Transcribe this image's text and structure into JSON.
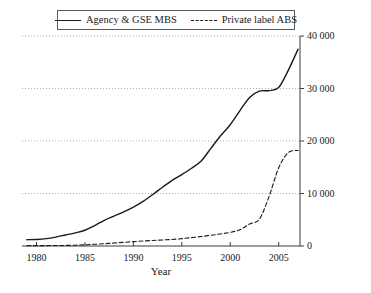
{
  "chart_data": {
    "type": "line",
    "title": "",
    "xlabel": "Year",
    "ylabel": "",
    "xlim": [
      1978.5,
      2007.2
    ],
    "ylim": [
      0,
      40000
    ],
    "grid": true,
    "grid_style": "dotted horizontal",
    "y_axis_position": "right",
    "legend_position": "top-center",
    "xticks": [
      1980,
      1985,
      1990,
      1995,
      2000,
      2005
    ],
    "xtick_labels": [
      "1980",
      "1985",
      "1990",
      "1995",
      "2000",
      "2005"
    ],
    "yticks": [
      0,
      10000,
      20000,
      30000,
      40000
    ],
    "ytick_labels": [
      "0",
      "10 000",
      "20 000",
      "30 000",
      "40 000"
    ],
    "series": [
      {
        "name": "Agency & GSE MBS",
        "style": "solid",
        "color": "#1a1a1a",
        "x": [
          1979,
          1980,
          1981,
          1982,
          1983,
          1984,
          1985,
          1986,
          1987,
          1988,
          1989,
          1990,
          1991,
          1992,
          1993,
          1994,
          1995,
          1996,
          1997,
          1998,
          1999,
          2000,
          2001,
          2002,
          2003,
          2004,
          2005,
          2006,
          2007
        ],
        "values": [
          1200,
          1250,
          1400,
          1700,
          2100,
          2500,
          3000,
          3900,
          4900,
          5700,
          6500,
          7400,
          8500,
          9800,
          11200,
          12500,
          13600,
          14800,
          16200,
          18600,
          21000,
          23100,
          25800,
          28300,
          29500,
          29600,
          30200,
          33500,
          37500
        ]
      },
      {
        "name": "Private label ABS",
        "style": "dashed",
        "color": "#1a1a1a",
        "x": [
          1979,
          1980,
          1981,
          1982,
          1983,
          1984,
          1985,
          1986,
          1987,
          1988,
          1989,
          1990,
          1991,
          1992,
          1993,
          1994,
          1995,
          1996,
          1997,
          1998,
          1999,
          2000,
          2001,
          2002,
          2003,
          2004,
          2005,
          2006,
          2007
        ],
        "values": [
          60,
          70,
          80,
          90,
          110,
          150,
          220,
          320,
          430,
          560,
          700,
          830,
          950,
          1050,
          1150,
          1250,
          1400,
          1600,
          1800,
          2050,
          2300,
          2600,
          3100,
          4200,
          5100,
          9400,
          14900,
          17800,
          18200
        ]
      }
    ]
  },
  "legend": {
    "entries": [
      {
        "label": "Agency & GSE MBS",
        "style": "solid"
      },
      {
        "label": "Private label ABS",
        "style": "dashed"
      }
    ]
  },
  "axes": {
    "x_title": "Year"
  }
}
